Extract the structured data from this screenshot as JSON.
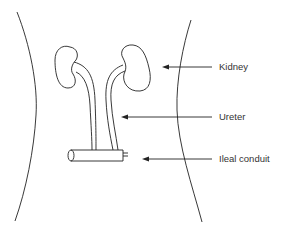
{
  "diagram": {
    "labels": {
      "kidney": "Kidney",
      "ureter": "Ureter",
      "ileal_conduit": "Ileal conduit"
    },
    "colors": {
      "stroke": "#222222",
      "text": "#333333",
      "background": "#ffffff"
    }
  }
}
